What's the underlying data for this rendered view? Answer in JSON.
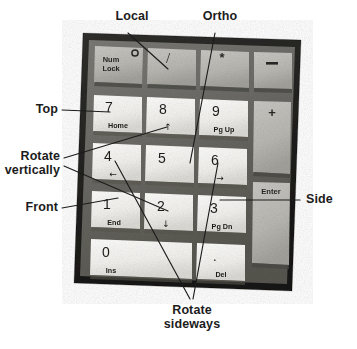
{
  "figure": {
    "type": "annotated-photograph",
    "background_color": "#ffffff",
    "ink_color": "#1c1c1c"
  },
  "callouts": [
    {
      "id": "local",
      "label": "Local",
      "position": "top",
      "points_to": "slash-key"
    },
    {
      "id": "ortho",
      "label": "Ortho",
      "position": "top",
      "points_to": "key-5"
    },
    {
      "id": "top",
      "label": "Top",
      "position": "left",
      "points_to": "key-7"
    },
    {
      "id": "rotate-vertically",
      "label": "Rotate\nvertically",
      "position": "left",
      "points_to": "key-8, key-2"
    },
    {
      "id": "front",
      "label": "Front",
      "position": "left",
      "points_to": "key-1"
    },
    {
      "id": "side",
      "label": "Side",
      "position": "right",
      "points_to": "key-3"
    },
    {
      "id": "rotate-sideways",
      "label": "Rotate\nsideways",
      "position": "bottom",
      "points_to": "key-4, key-6"
    }
  ],
  "keypad": {
    "rows": [
      [
        {
          "id": "num-lock",
          "primary": "Num",
          "secondary": "Lock",
          "led": true,
          "span": 1,
          "tall": false,
          "tone": "dim"
        },
        {
          "id": "slash",
          "primary": "/",
          "secondary": "",
          "led": false,
          "span": 1,
          "tall": false,
          "tone": "dim"
        },
        {
          "id": "asterisk",
          "primary": "*",
          "secondary": "",
          "led": false,
          "span": 1,
          "tall": false,
          "tone": "dim"
        },
        {
          "id": "minus",
          "primary": "−",
          "secondary": "",
          "led": false,
          "span": 1,
          "tall": false,
          "tone": "dim"
        }
      ],
      [
        {
          "id": "key-7",
          "primary": "7",
          "secondary": "Home",
          "led": false,
          "span": 1,
          "tall": false,
          "tone": "bright"
        },
        {
          "id": "key-8",
          "primary": "8",
          "secondary": "↑",
          "led": false,
          "span": 1,
          "tall": false,
          "tone": "bright"
        },
        {
          "id": "key-9",
          "primary": "9",
          "secondary": "Pg Up",
          "led": false,
          "span": 1,
          "tall": false,
          "tone": "bright"
        },
        {
          "id": "plus",
          "primary": "+",
          "secondary": "",
          "led": false,
          "span": 1,
          "tall": true,
          "tone": "dim"
        }
      ],
      [
        {
          "id": "key-4",
          "primary": "4",
          "secondary": "←",
          "led": false,
          "span": 1,
          "tall": false,
          "tone": "bright"
        },
        {
          "id": "key-5",
          "primary": "5",
          "secondary": "",
          "led": false,
          "span": 1,
          "tall": false,
          "tone": "bright"
        },
        {
          "id": "key-6",
          "primary": "6",
          "secondary": "→",
          "led": false,
          "span": 1,
          "tall": false,
          "tone": "bright"
        }
      ],
      [
        {
          "id": "key-1",
          "primary": "1",
          "secondary": "End",
          "led": false,
          "span": 1,
          "tall": false,
          "tone": "bright"
        },
        {
          "id": "key-2",
          "primary": "2",
          "secondary": "↓",
          "led": false,
          "span": 1,
          "tall": false,
          "tone": "bright"
        },
        {
          "id": "key-3",
          "primary": "3",
          "secondary": "Pg Dn",
          "led": false,
          "span": 1,
          "tall": false,
          "tone": "bright"
        },
        {
          "id": "enter",
          "primary": "Enter",
          "secondary": "",
          "led": false,
          "span": 1,
          "tall": true,
          "tone": "dim"
        }
      ],
      [
        {
          "id": "key-0",
          "primary": "0",
          "secondary": "Ins",
          "led": false,
          "span": 2,
          "tall": false,
          "tone": "bright"
        },
        {
          "id": "key-dot",
          "primary": ".",
          "secondary": "Del",
          "led": false,
          "span": 1,
          "tall": false,
          "tone": "bright"
        }
      ]
    ]
  }
}
